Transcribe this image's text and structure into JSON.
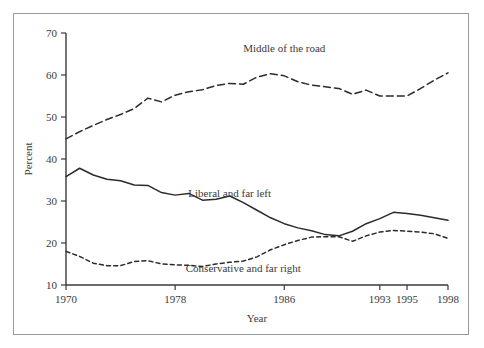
{
  "chart_data": {
    "type": "line",
    "title": "",
    "xlabel": "Year",
    "ylabel": "Percent",
    "xlim": [
      1970,
      1998
    ],
    "ylim": [
      10,
      70
    ],
    "grid": false,
    "legend_position": "inline-annotations",
    "xticks": [
      1970,
      1978,
      1986,
      1993,
      1995,
      1998
    ],
    "xtick_labels": [
      "1970",
      "1978",
      "1986",
      "1993",
      "1995",
      "1998"
    ],
    "yticks": [
      10,
      20,
      30,
      40,
      50,
      60,
      70
    ],
    "ytick_labels": [
      "10",
      "20",
      "30",
      "40",
      "50",
      "60",
      "70"
    ],
    "x": [
      1970,
      1971,
      1972,
      1973,
      1974,
      1975,
      1976,
      1977,
      1978,
      1979,
      1980,
      1981,
      1982,
      1983,
      1984,
      1985,
      1986,
      1987,
      1988,
      1989,
      1990,
      1991,
      1992,
      1993,
      1994,
      1995,
      1996,
      1997,
      1998
    ],
    "series": [
      {
        "name": "Middle of the road",
        "style": "dashed-long",
        "color": "#2b2b2b",
        "label_x": 1986,
        "label_y": 65.5,
        "values": [
          44.8,
          46.5,
          48.0,
          49.4,
          50.6,
          52.0,
          54.5,
          53.6,
          55.2,
          56.0,
          56.5,
          57.5,
          58.0,
          57.8,
          59.5,
          60.3,
          59.8,
          58.4,
          57.6,
          57.2,
          56.8,
          55.4,
          56.4,
          55.0,
          55.0,
          55.0,
          56.8,
          58.8,
          60.5
        ]
      },
      {
        "name": "Liberal and far left",
        "style": "solid",
        "color": "#2b2b2b",
        "label_x": 1982,
        "label_y": 31.0,
        "values": [
          35.8,
          37.8,
          36.2,
          35.2,
          34.8,
          33.8,
          33.7,
          32.0,
          31.4,
          31.8,
          30.2,
          30.4,
          31.2,
          29.6,
          27.8,
          26.0,
          24.6,
          23.6,
          22.9,
          22.0,
          21.7,
          22.8,
          24.6,
          25.8,
          27.3,
          27.0,
          26.6,
          26.0,
          25.4
        ]
      },
      {
        "name": "Conservative and far right",
        "style": "dashed-short",
        "color": "#2b2b2b",
        "label_x": 1983,
        "label_y": 13.0,
        "values": [
          18.0,
          16.8,
          15.2,
          14.6,
          14.6,
          15.6,
          15.8,
          15.0,
          14.8,
          14.7,
          14.4,
          15.0,
          15.4,
          15.7,
          16.7,
          18.4,
          19.6,
          20.6,
          21.4,
          21.5,
          21.5,
          20.4,
          21.7,
          22.6,
          23.0,
          22.8,
          22.6,
          22.2,
          21.1
        ]
      }
    ]
  },
  "annotations": {
    "middle_label": "Middle of the road",
    "liberal_label": "Liberal and far left",
    "conservative_label": "Conservative and far right"
  }
}
